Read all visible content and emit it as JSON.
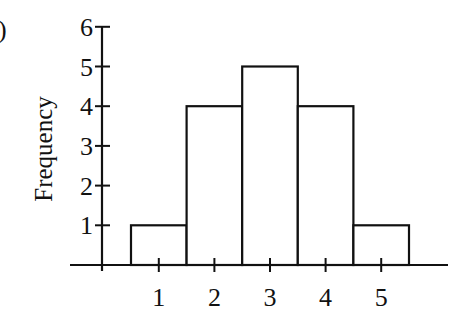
{
  "panel_label": ")",
  "chart_data": {
    "type": "bar",
    "title": "",
    "xlabel": "",
    "ylabel": "Frequency",
    "categories": [
      "1",
      "2",
      "3",
      "4",
      "5"
    ],
    "values": [
      1,
      4,
      5,
      4,
      1
    ],
    "x_ticks": [
      "1",
      "2",
      "3",
      "4",
      "5"
    ],
    "y_ticks": [
      "1",
      "2",
      "3",
      "4",
      "5",
      "6"
    ],
    "ylim": [
      0,
      6
    ],
    "grid": false,
    "legend": null,
    "bar_style": {
      "fill": "#ffffff",
      "stroke": "#111111"
    },
    "histogram": true
  }
}
